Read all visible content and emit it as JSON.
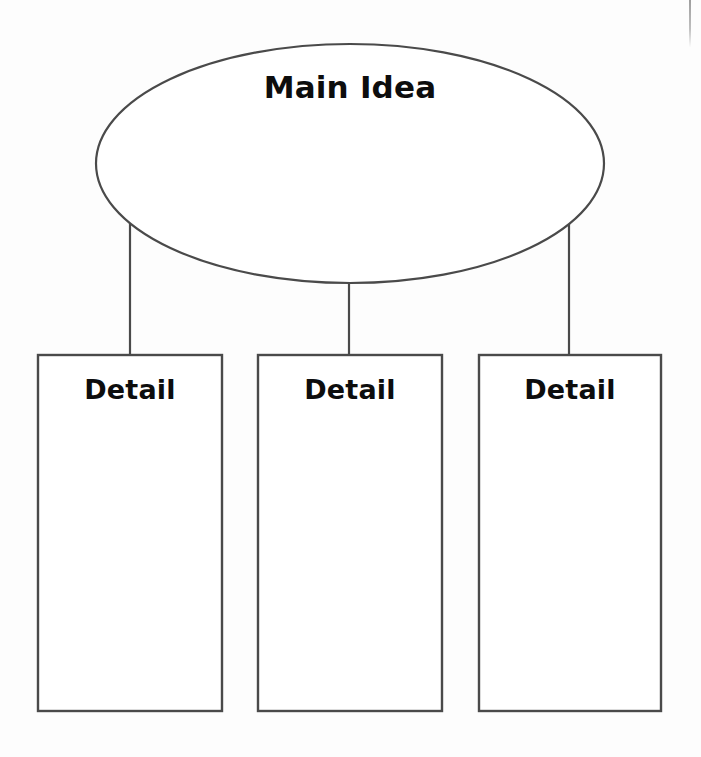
{
  "diagram": {
    "type": "main-idea-and-details-graphic-organizer",
    "background_color": "#fdfdfd",
    "stroke_color": "#4a4a4a",
    "text_color": "#0d0d0d",
    "main_idea": {
      "shape": "ellipse",
      "label": "Main Idea",
      "center_x": 350,
      "center_y": 163,
      "radius_x": 254,
      "radius_y": 119
    },
    "details": [
      {
        "shape": "rectangle",
        "label": "Detail",
        "x": 37,
        "y": 354,
        "width": 185,
        "height": 357,
        "connector_x": 130,
        "connector_y_start": 222,
        "connector_y_end": 354
      },
      {
        "shape": "rectangle",
        "label": "Detail",
        "x": 257,
        "y": 354,
        "width": 185,
        "height": 357,
        "connector_x": 349,
        "connector_y_start": 283,
        "connector_y_end": 354
      },
      {
        "shape": "rectangle",
        "label": "Detail",
        "x": 478,
        "y": 354,
        "width": 183,
        "height": 357,
        "connector_x": 569,
        "connector_y_start": 222,
        "connector_y_end": 354
      }
    ]
  }
}
